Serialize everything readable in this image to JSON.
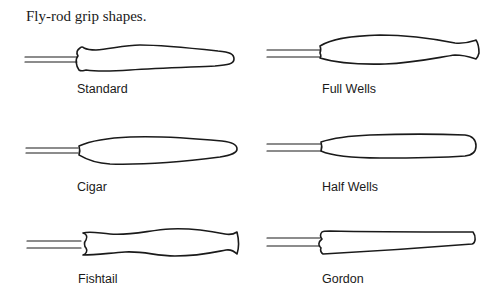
{
  "title": "Fly-rod grip shapes.",
  "grips": [
    {
      "id": "standard",
      "label": "Standard"
    },
    {
      "id": "full-wells",
      "label": "Full Wells"
    },
    {
      "id": "cigar",
      "label": "Cigar"
    },
    {
      "id": "half-wells",
      "label": "Half Wells"
    },
    {
      "id": "fishtail",
      "label": "Fishtail"
    },
    {
      "id": "gordon",
      "label": "Gordon"
    }
  ],
  "colors": {
    "ink": "#1a1a1a",
    "background": "#ffffff"
  }
}
